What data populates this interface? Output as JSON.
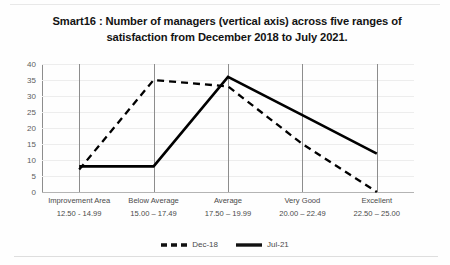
{
  "chart_data": {
    "type": "line",
    "title": "Smart16 : Number of managers (vertical axis) across five ranges of satisfaction  from December 2018 to July 2021.",
    "title_line1": "Smart16 : Number of managers (vertical axis) across five",
    "title_line2": "ranges of satisfaction  from December 2018 to July 2021.",
    "xlabel": "",
    "ylabel": "",
    "ylim": [
      0,
      40
    ],
    "yticks": [
      0,
      5,
      10,
      15,
      20,
      25,
      30,
      35,
      40
    ],
    "grid": true,
    "legend_position": "bottom",
    "categories": [
      "Improvement Area",
      "Below Average",
      "Average",
      "Very Good",
      "Excellent"
    ],
    "category_ranges": [
      "12.50 - 14.99",
      "15.00 – 17.49",
      "17.50 – 19.99",
      "20.00 – 22.49",
      "22.50 – 25.00"
    ],
    "series": [
      {
        "name": "Dec-18",
        "style": "dashed",
        "color": "#000000",
        "values": [
          7,
          35,
          33,
          15,
          0
        ]
      },
      {
        "name": "Jul-21",
        "style": "solid",
        "color": "#000000",
        "values": [
          8,
          8,
          36,
          24,
          12
        ]
      }
    ]
  },
  "axis": {
    "tick_0": "0",
    "tick_5": "5",
    "tick_10": "10",
    "tick_15": "15",
    "tick_20": "20",
    "tick_25": "25",
    "tick_30": "30",
    "tick_35": "35",
    "tick_40": "40"
  },
  "categories": {
    "c0_name": "Improvement Area",
    "c0_range": "12.50 - 14.99",
    "c1_name": "Below Average",
    "c1_range": "15.00 – 17.49",
    "c2_name": "Average",
    "c2_range": "17.50 – 19.99",
    "c3_name": "Very Good",
    "c3_range": "20.00 – 22.49",
    "c4_name": "Excellent",
    "c4_range": "22.50 – 25.00"
  },
  "legend": {
    "series1_label": "Dec-18",
    "series2_label": "Jul-21"
  }
}
